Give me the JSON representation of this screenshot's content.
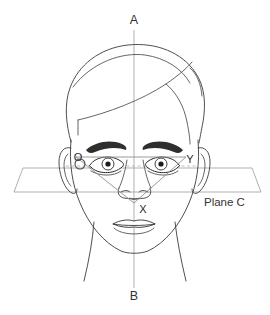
{
  "diagram": {
    "background_color": "#ffffff",
    "line_color": "#3b3b3b",
    "guide_color": "#a0a0a0",
    "axis": {
      "name": "vertical-axis",
      "top_label": "A",
      "bottom_label": "B",
      "top_label_x": 134,
      "top_label_y": 21,
      "bottom_label_x": 134,
      "bottom_label_y": 297,
      "line_x": 134,
      "line_y_top": 30,
      "line_y_bottom": 288
    },
    "plane": {
      "name": "plane-c",
      "label": "Plane C",
      "label_x": 204,
      "label_y": 203,
      "points": "23,168 252,168 261,192 14,192"
    },
    "triangle": {
      "name": "measurement-triangle",
      "vertex_left_label": "O",
      "vertex_right_label": "Y",
      "vertex_bottom_label": "X",
      "vertex_left_x": 76,
      "vertex_left_y": 157,
      "vertex_right_x": 186,
      "vertex_right_y": 157,
      "vertex_bottom_x": 134,
      "vertex_bottom_y": 203,
      "label_left_x": 78,
      "label_left_y": 158,
      "label_right_x": 190,
      "label_right_y": 160,
      "label_bottom_x": 143,
      "label_bottom_y": 210,
      "marker_circle_x": 80,
      "marker_circle_y": 164,
      "marker_circle_r": 5
    },
    "eye_line": {
      "name": "eye-level-guide",
      "y": 166,
      "x_start": 66,
      "x_end": 198
    },
    "features": [
      {
        "name": "hair-outline",
        "visible": true
      },
      {
        "name": "face-outline",
        "visible": true
      },
      {
        "name": "left-ear",
        "visible": true
      },
      {
        "name": "right-ear",
        "visible": true
      },
      {
        "name": "left-eyebrow",
        "visible": true
      },
      {
        "name": "right-eyebrow",
        "visible": true
      },
      {
        "name": "left-eye",
        "visible": true
      },
      {
        "name": "right-eye",
        "visible": true
      },
      {
        "name": "nose",
        "visible": true
      },
      {
        "name": "mouth",
        "visible": true
      },
      {
        "name": "neck",
        "visible": true
      }
    ]
  }
}
